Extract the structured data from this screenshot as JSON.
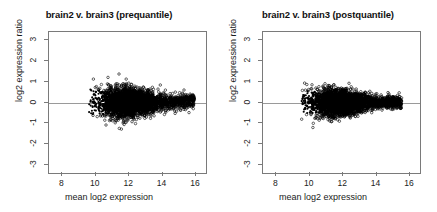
{
  "figure": {
    "background_color": "#ffffff",
    "point_color": "#000000",
    "axis_color": "#7a7a7a",
    "zero_line_color": "#9a9a9a"
  },
  "chart_data": [
    {
      "type": "scatter",
      "title": "brain2 v. brain3 (prequantile)",
      "xlabel": "mean log2 expression",
      "ylabel": "log2 expression ratio",
      "xlim": [
        7.2,
        16.6
      ],
      "ylim": [
        -3.4,
        3.4
      ],
      "xticks": [
        8,
        10,
        12,
        14,
        16
      ],
      "yticks": [
        3,
        2,
        1,
        0,
        -1,
        -2,
        -3
      ],
      "xtick_labels": [
        "8",
        "10",
        "12",
        "14",
        "16"
      ],
      "ytick_labels": [
        "3",
        "2",
        "1",
        "0",
        "-1",
        "-2",
        "-3"
      ],
      "grid": false,
      "legend": "none",
      "marker": "open-circle",
      "reference_line_y": 0,
      "cloud": {
        "x_range": [
          9.6,
          15.9
        ],
        "y_range": [
          -1.35,
          1.15
        ],
        "x_dense_core": [
          10.0,
          14.2
        ],
        "y_core_spread": 0.3,
        "skew": "right-tailed, slightly upward-shifted at high expression",
        "n_points": 4200
      }
    },
    {
      "type": "scatter",
      "title": "brain2 v. brain3 (postquantile)",
      "xlabel": "mean log2 expression",
      "ylabel": "log2 expression ratio",
      "xlim": [
        7.2,
        16.6
      ],
      "ylim": [
        -3.4,
        3.4
      ],
      "xticks": [
        8,
        10,
        12,
        14,
        16
      ],
      "yticks": [
        3,
        2,
        1,
        0,
        -1,
        -2,
        -3
      ],
      "xtick_labels": [
        "8",
        "10",
        "12",
        "14",
        "16"
      ],
      "ytick_labels": [
        "3",
        "2",
        "1",
        "0",
        "-1",
        "-2",
        "-3"
      ],
      "grid": false,
      "legend": "none",
      "marker": "open-circle",
      "reference_line_y": 0,
      "cloud": {
        "x_range": [
          9.5,
          15.5
        ],
        "y_range": [
          -1.25,
          1.15
        ],
        "x_dense_core": [
          9.8,
          14.0
        ],
        "y_core_spread": 0.27,
        "skew": "more symmetric about zero after quantile normalization",
        "n_points": 4200
      }
    }
  ]
}
